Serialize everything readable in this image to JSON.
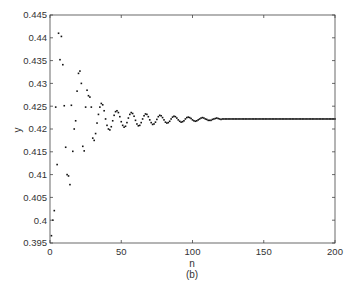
{
  "chart_data": {
    "type": "scatter",
    "title": "",
    "subtitle": "(b)",
    "xlabel": "n",
    "ylabel": "y",
    "xlim": [
      0,
      200
    ],
    "ylim": [
      0.395,
      0.445
    ],
    "xticks": [
      0,
      50,
      100,
      150,
      200
    ],
    "yticks": [
      0.395,
      0.4,
      0.405,
      0.41,
      0.415,
      0.42,
      0.425,
      0.43,
      0.435,
      0.44,
      0.445
    ],
    "ytick_labels": [
      "0.395",
      "0.4",
      "0.405",
      "0.41",
      "0.415",
      "0.42",
      "0.425",
      "0.43",
      "0.435",
      "0.44",
      "0.445"
    ],
    "xtick_labels": [
      "0",
      "50",
      "100",
      "150",
      "200"
    ],
    "grid": false,
    "legend": null,
    "steady_state": 0.4222,
    "points": [
      [
        1,
        0.3966
      ],
      [
        2,
        0.4
      ],
      [
        3,
        0.4021
      ],
      [
        4,
        0.4248
      ],
      [
        5,
        0.4122
      ],
      [
        6,
        0.441
      ],
      [
        7,
        0.4352
      ],
      [
        8,
        0.4403
      ],
      [
        9,
        0.4341
      ],
      [
        10,
        0.4251
      ],
      [
        11,
        0.416
      ],
      [
        12,
        0.41
      ],
      [
        13,
        0.4097
      ],
      [
        14,
        0.4078
      ],
      [
        15,
        0.4252
      ],
      [
        16,
        0.4151
      ],
      [
        17,
        0.42
      ],
      [
        18,
        0.4218
      ],
      [
        19,
        0.4283
      ],
      [
        20,
        0.4322
      ],
      [
        21,
        0.4327
      ],
      [
        22,
        0.43
      ],
      [
        23,
        0.4162
      ],
      [
        24,
        0.4152
      ],
      [
        25,
        0.4248
      ],
      [
        26,
        0.4285
      ],
      [
        27,
        0.4273
      ],
      [
        28,
        0.427
      ],
      [
        29,
        0.4248
      ],
      [
        30,
        0.418
      ],
      [
        31,
        0.4175
      ],
      [
        32,
        0.419
      ],
      [
        33,
        0.4213
      ],
      [
        34,
        0.4232
      ],
      [
        35,
        0.4248
      ],
      [
        36,
        0.4256
      ],
      [
        37,
        0.4253
      ],
      [
        38,
        0.424
      ],
      [
        39,
        0.4222
      ],
      [
        40,
        0.4208
      ],
      [
        41,
        0.42
      ],
      [
        42,
        0.4198
      ],
      [
        43,
        0.4205
      ],
      [
        44,
        0.4218
      ],
      [
        45,
        0.423
      ],
      [
        46,
        0.4238
      ],
      [
        47,
        0.424
      ],
      [
        48,
        0.4236
      ],
      [
        49,
        0.4227
      ],
      [
        50,
        0.4216
      ],
      [
        51,
        0.4208
      ],
      [
        52,
        0.4204
      ],
      [
        53,
        0.4206
      ],
      [
        54,
        0.4214
      ],
      [
        55,
        0.4224
      ],
      [
        56,
        0.4232
      ],
      [
        57,
        0.4236
      ],
      [
        58,
        0.4234
      ],
      [
        59,
        0.4228
      ],
      [
        60,
        0.4219
      ],
      [
        61,
        0.4211
      ],
      [
        62,
        0.4207
      ],
      [
        63,
        0.4208
      ],
      [
        64,
        0.4214
      ],
      [
        65,
        0.4222
      ],
      [
        66,
        0.4229
      ],
      [
        67,
        0.4233
      ],
      [
        68,
        0.4232
      ],
      [
        69,
        0.4227
      ],
      [
        70,
        0.422
      ],
      [
        71,
        0.4214
      ],
      [
        72,
        0.421
      ],
      [
        73,
        0.4211
      ],
      [
        74,
        0.4215
      ],
      [
        75,
        0.4221
      ],
      [
        76,
        0.4227
      ],
      [
        77,
        0.423
      ],
      [
        78,
        0.4229
      ],
      [
        79,
        0.4225
      ],
      [
        80,
        0.422
      ],
      [
        81,
        0.4215
      ],
      [
        82,
        0.4213
      ],
      [
        83,
        0.4214
      ],
      [
        84,
        0.4217
      ],
      [
        85,
        0.4222
      ],
      [
        86,
        0.4226
      ],
      [
        87,
        0.4228
      ],
      [
        88,
        0.4227
      ],
      [
        89,
        0.4224
      ],
      [
        90,
        0.422
      ],
      [
        91,
        0.4217
      ],
      [
        92,
        0.4215
      ],
      [
        93,
        0.4216
      ],
      [
        94,
        0.4218
      ],
      [
        95,
        0.4222
      ],
      [
        96,
        0.4225
      ],
      [
        97,
        0.4226
      ],
      [
        98,
        0.4225
      ],
      [
        99,
        0.4223
      ],
      [
        100,
        0.422
      ],
      [
        101,
        0.4218
      ],
      [
        102,
        0.4217
      ],
      [
        103,
        0.4218
      ],
      [
        104,
        0.422
      ],
      [
        105,
        0.4222
      ],
      [
        106,
        0.4224
      ],
      [
        107,
        0.4225
      ],
      [
        108,
        0.4224
      ],
      [
        109,
        0.4222
      ],
      [
        110,
        0.4221
      ],
      [
        111,
        0.4219
      ],
      [
        112,
        0.4219
      ],
      [
        113,
        0.4219
      ],
      [
        114,
        0.4221
      ],
      [
        115,
        0.4222
      ],
      [
        116,
        0.4223
      ],
      [
        117,
        0.4224
      ],
      [
        118,
        0.4223
      ],
      [
        119,
        0.4222
      ],
      [
        120,
        0.4221
      ]
    ],
    "tail": {
      "from": 121,
      "to": 200,
      "value": 0.4222
    }
  }
}
